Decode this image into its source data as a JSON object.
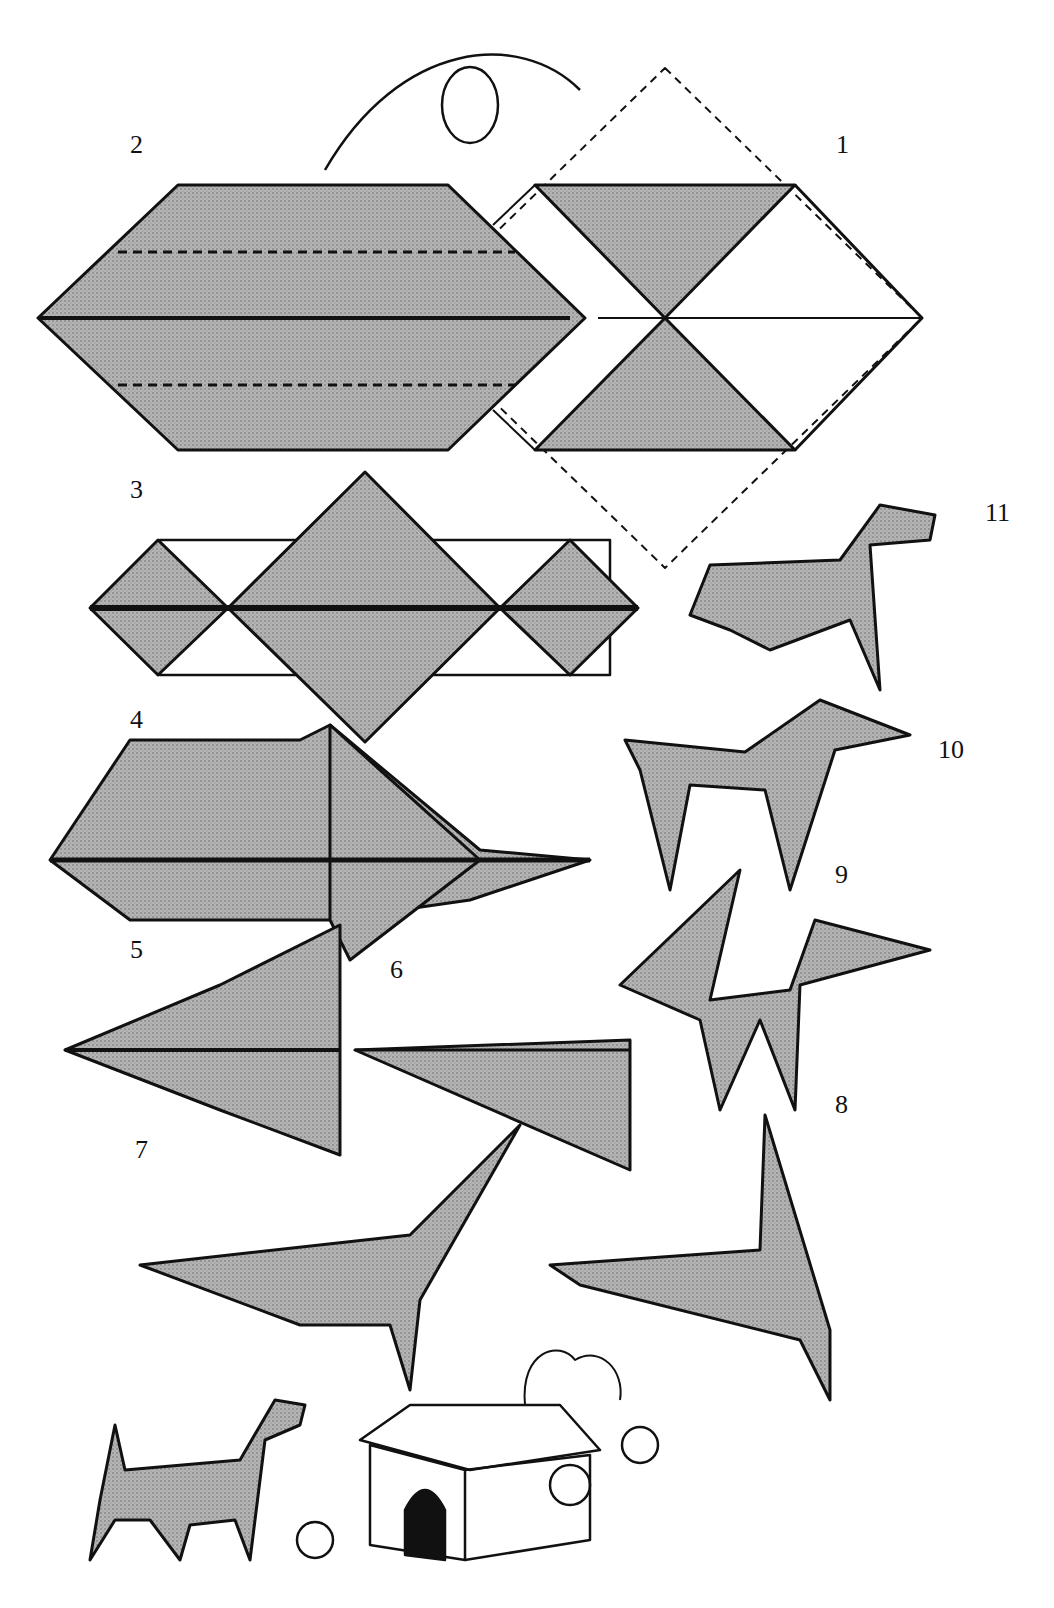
{
  "diagram": {
    "steps": [
      {
        "label": "1",
        "x": 836,
        "y": 130
      },
      {
        "label": "2",
        "x": 130,
        "y": 130
      },
      {
        "label": "3",
        "x": 130,
        "y": 475
      },
      {
        "label": "4",
        "x": 130,
        "y": 705
      },
      {
        "label": "5",
        "x": 130,
        "y": 935
      },
      {
        "label": "6",
        "x": 390,
        "y": 955
      },
      {
        "label": "7",
        "x": 135,
        "y": 1135
      },
      {
        "label": "8",
        "x": 835,
        "y": 1090
      },
      {
        "label": "9",
        "x": 835,
        "y": 860
      },
      {
        "label": "10",
        "x": 938,
        "y": 735
      },
      {
        "label": "11",
        "x": 985,
        "y": 498
      }
    ],
    "colors": {
      "fill": "#9a9a9a",
      "stroke": "#111111"
    }
  }
}
